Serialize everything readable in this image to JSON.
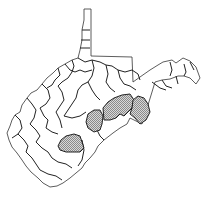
{
  "map": {
    "region": "West Virginia",
    "subdivision": "counties",
    "highlight_fill": "#b0b0b0",
    "highlighted_counties": [
      "Raleigh",
      "Webster",
      "Randolph",
      "Pendleton"
    ]
  }
}
